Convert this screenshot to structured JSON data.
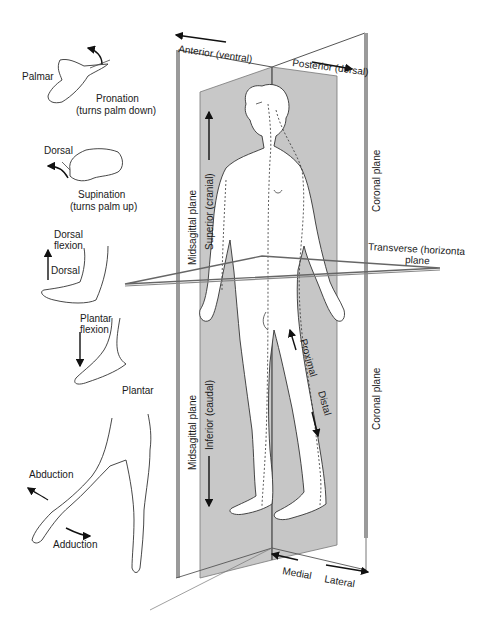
{
  "diagram": {
    "title_region": "Anatomical planes and directional terms",
    "planes": {
      "anterior": "Anterior (ventral)",
      "posterior": "Posterior (dorsal)",
      "midsagittal_upper": "Midsagittal plane",
      "midsagittal_lower": "Midsagittal plane",
      "coronal_upper": "Coronal plane",
      "coronal_lower": "Coronal plane",
      "transverse_line1": "Transverse (horizonta",
      "transverse_line2": "plane"
    },
    "directions": {
      "superior": "Superior (cranial)",
      "inferior": "Inferior (caudal)",
      "proximal": "Proximal",
      "distal": "Distal",
      "medial": "Medial",
      "lateral": "Lateral"
    },
    "hand_movements": {
      "palmar": "Palmar",
      "pronation": "Pronation",
      "pronation_note": "(turns palm down)",
      "dorsal": "Dorsal",
      "supination": "Supination",
      "supination_note": "(turns palm up)"
    },
    "foot_movements": {
      "dorsal_flexion_1": "Dorsal",
      "dorsal_flexion_2": "flexion",
      "dorsal": "Dorsal",
      "plantar_flexion_1": "Plantar",
      "plantar_flexion_2": "flexion",
      "plantar": "Plantar"
    },
    "leg_movements": {
      "abduction": "Abduction",
      "adduction": "Adduction"
    },
    "colors": {
      "plane_fill": "#c8c8c8",
      "plane_edge": "#8a8a8a",
      "line": "#333333"
    }
  }
}
